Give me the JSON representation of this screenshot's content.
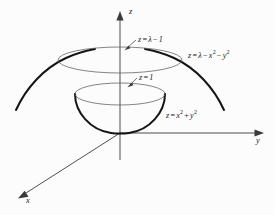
{
  "figure": {
    "background_color": "#fcfcfc",
    "width": 274,
    "height": 215
  },
  "axes": {
    "z": {
      "label": "z",
      "direction": "up",
      "arrow": "arrow-up-icon"
    },
    "y": {
      "label": "y",
      "direction": "right",
      "arrow": "arrow-right-icon"
    },
    "x": {
      "label": "x",
      "direction": "down-left",
      "arrow": "arrow-down-left-icon"
    },
    "origin": {
      "x": 120,
      "y": 133
    },
    "line_color": "#3a3a3a"
  },
  "labels": {
    "upper_plane": {
      "lhs": "z",
      "eq": "=",
      "rhs_lambda": "λ",
      "minus": "−",
      "rhs_one": "1",
      "full_text": "z = λ − 1"
    },
    "lower_plane": {
      "lhs": "z",
      "eq": "=",
      "rhs": "1",
      "full_text": "z = 1"
    },
    "upper_surface": {
      "lhs": "z",
      "eq": "=",
      "lambda": "λ",
      "minus1": "−",
      "x": "x",
      "xexp": "2",
      "minus2": "−",
      "y": "y",
      "yexp": "2",
      "full_text": "z = λ − x² − y²"
    },
    "lower_surface": {
      "lhs": "z",
      "eq": "=",
      "x": "x",
      "xexp": "2",
      "plus": "+",
      "y": "y",
      "yexp": "2",
      "full_text": "z = x² + y²"
    }
  },
  "surfaces": {
    "upper_paraboloid": {
      "name": "inverted-paraboloid",
      "equation": "z = λ − x² − y²",
      "stroke": "#141414",
      "cross_section_level": "z = λ − 1"
    },
    "lower_paraboloid": {
      "name": "upward-paraboloid-bowl",
      "equation": "z = x² + y²",
      "stroke": "#141414",
      "cross_section_level": "z = 1"
    },
    "upper_ellipse": {
      "name": "upper-cross-section-ellipse",
      "cx": 120,
      "cy": 60,
      "rx": 62,
      "ry": 13,
      "stroke": "#5c5c5c"
    },
    "lower_ellipse": {
      "name": "lower-cross-section-ellipse",
      "cx": 120,
      "cy": 94,
      "rx": 45,
      "ry": 11,
      "stroke": "#5c5c5c"
    }
  }
}
